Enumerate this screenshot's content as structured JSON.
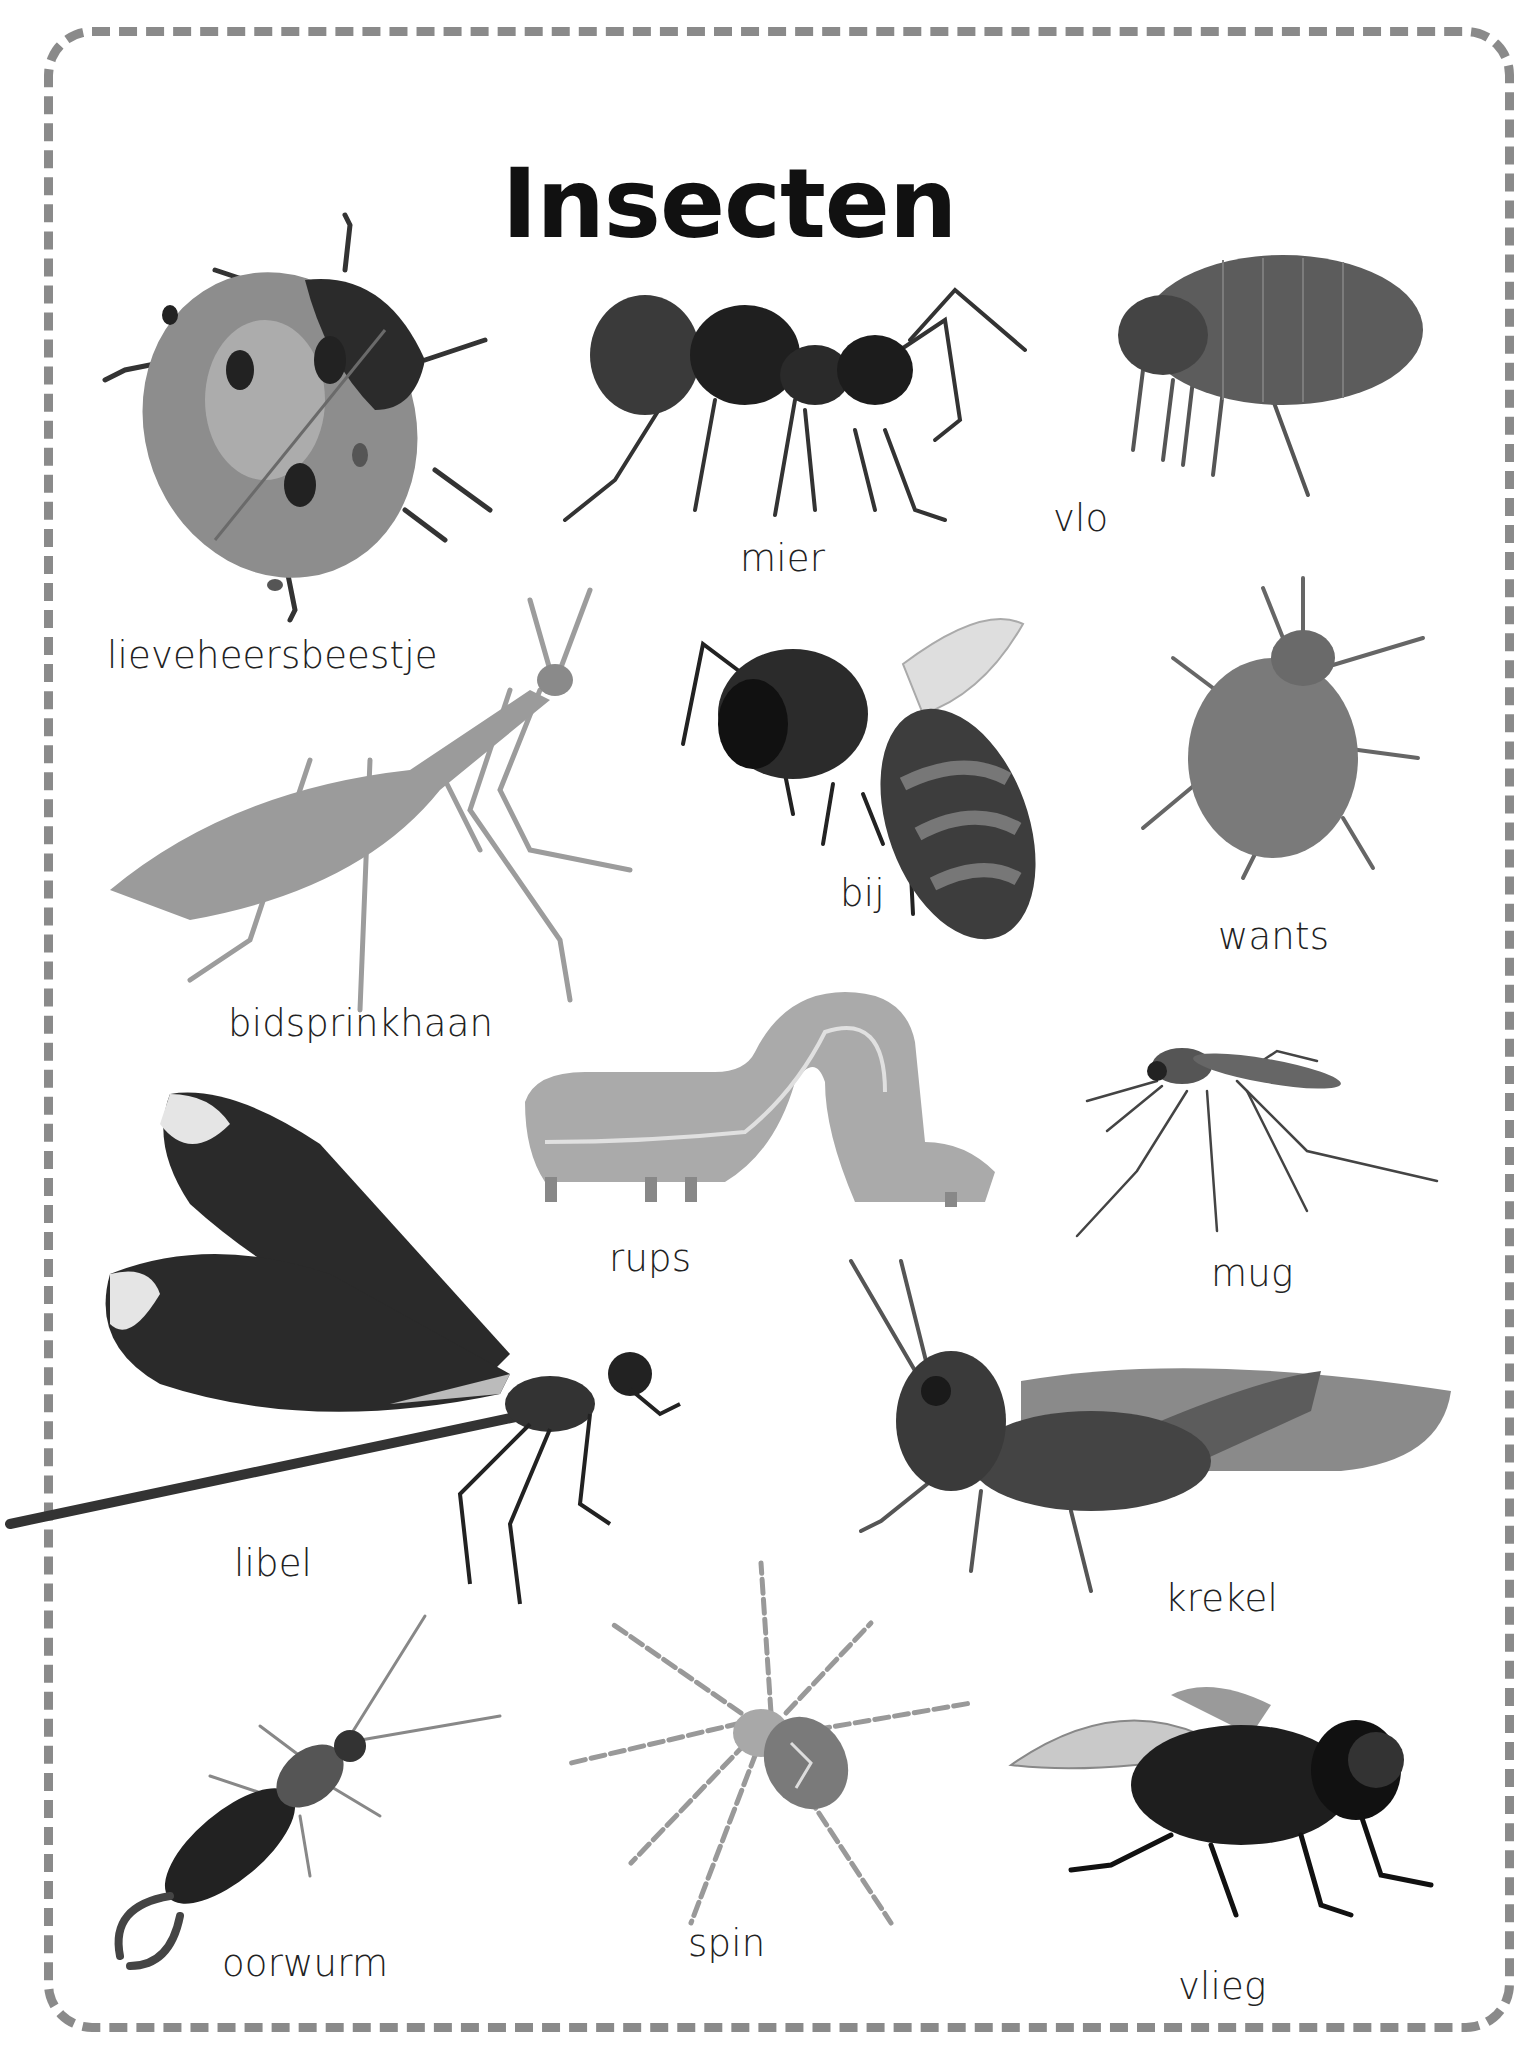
{
  "page": {
    "title": "Insecten",
    "border_color": "#8a8a8a",
    "insects": [
      {
        "id": "lieveheersbeestje",
        "label": "lieveheersbeestje"
      },
      {
        "id": "mier",
        "label": "mier"
      },
      {
        "id": "vlo",
        "label": "vlo"
      },
      {
        "id": "bidsprinkhaan",
        "label": "bidsprinkhaan"
      },
      {
        "id": "bij",
        "label": "bij"
      },
      {
        "id": "wants",
        "label": "wants"
      },
      {
        "id": "rups",
        "label": "rups"
      },
      {
        "id": "mug",
        "label": "mug"
      },
      {
        "id": "libel",
        "label": "libel"
      },
      {
        "id": "krekel",
        "label": "krekel"
      },
      {
        "id": "oorwurm",
        "label": "oorwurm"
      },
      {
        "id": "spin",
        "label": "spin"
      },
      {
        "id": "vlieg",
        "label": "vlieg"
      }
    ]
  }
}
